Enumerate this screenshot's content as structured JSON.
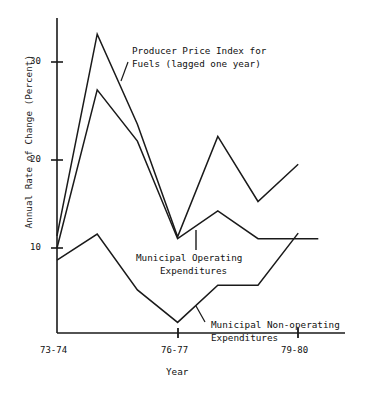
{
  "chart_data": {
    "type": "line",
    "title": "",
    "xlabel": "Year",
    "ylabel": "Annual Rate of Change (Percent)",
    "x_tick_labels": [
      "73-74",
      "76-77",
      "79-80"
    ],
    "x_tick_values": [
      0,
      3,
      6
    ],
    "y_tick_labels": [
      "10",
      "20",
      "30"
    ],
    "y_tick_values": [
      10,
      20,
      30
    ],
    "ylim": [
      0,
      35
    ],
    "xlim": [
      0,
      7
    ],
    "grid": false,
    "legend": "inline-annotations",
    "x_categories": [
      "73-74",
      "74-75",
      "75-76",
      "76-77",
      "77-78",
      "78-79",
      "79-80"
    ],
    "series": [
      {
        "name": "Producer Price Index for Fuels (lagged one year)",
        "x": [
          0,
          1,
          2,
          3,
          4,
          5,
          6
        ],
        "values": [
          11.3,
          33.0,
          23.3,
          11.2,
          22.0,
          15.0,
          19.0
        ]
      },
      {
        "name": "Municipal Operating Expenditures",
        "x": [
          0,
          1,
          2,
          3,
          4,
          5,
          6,
          6.5
        ],
        "values": [
          10.0,
          27.0,
          21.5,
          11.0,
          14.0,
          11.0,
          11.0,
          11.0
        ]
      },
      {
        "name": "Municipal Non-operating Expenditures",
        "x": [
          0,
          1,
          2,
          3,
          4,
          5,
          6
        ],
        "values": [
          8.7,
          11.5,
          5.5,
          2.0,
          6.0,
          6.0,
          11.6
        ]
      }
    ],
    "annotations": [
      {
        "id": "ppi-annotation",
        "line1": "Producer Price Index for",
        "line2": "Fuels (lagged one year)"
      },
      {
        "id": "operating-annotation",
        "line1": "Municipal Operating",
        "line2": "Expenditures"
      },
      {
        "id": "nonoperating-annotation",
        "line1": "Municipal Non-operating",
        "line2": "Expenditures"
      }
    ],
    "colors": {
      "line": "#1a1a1a",
      "axis": "#1a1a1a",
      "text": "#111111",
      "background": "#ffffff"
    }
  },
  "axes": {
    "y_title": "Annual Rate of Change (Percent)",
    "x_title": "Year",
    "y_ticks": [
      "30",
      "20",
      "10"
    ],
    "x_ticks": [
      "73-74",
      "76-77",
      "79-80"
    ]
  }
}
